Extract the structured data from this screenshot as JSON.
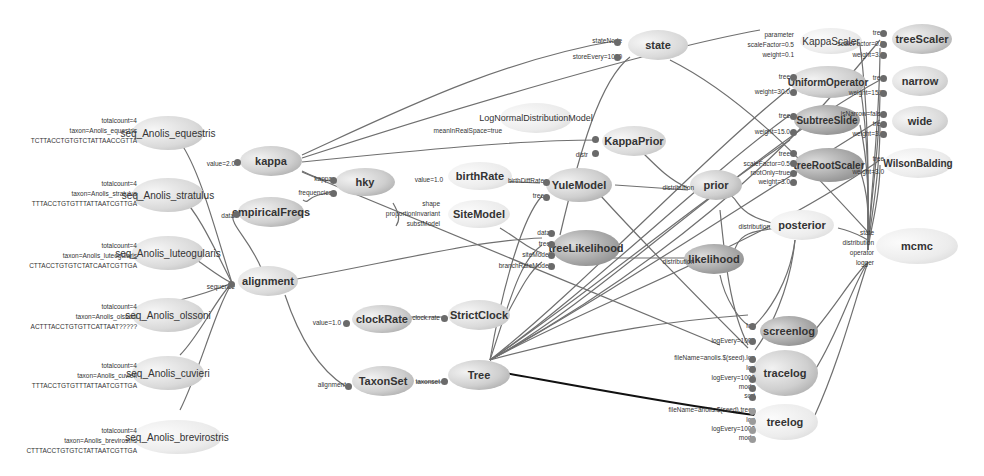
{
  "diagram": {
    "type": "BEAST model graph",
    "nodes": [
      {
        "id": "seq_Anolis_equestris",
        "label": "seq_Anolis_equestris",
        "inputs": [
          "totalcount=4",
          "taxon=Anolis_equestris",
          "TCTTACCTGTGTCTATTAACCGTTA"
        ]
      },
      {
        "id": "seq_Anolis_stratulus",
        "label": "seq_Anolis_stratulus",
        "inputs": [
          "totalcount=4",
          "taxon=Anolis_stratulus",
          "TTTACCTGTGTTTATTAATCGTTGA"
        ]
      },
      {
        "id": "seq_Anolis_luteogularis",
        "label": "seq_Anolis_luteogularis",
        "inputs": [
          "totalcount=4",
          "taxon=Anolis_luteogularis",
          "CTTACCTGTGTCTATCAATCGTTGA"
        ]
      },
      {
        "id": "seq_Anolis_olssoni",
        "label": "seq_Anolis_olssoni",
        "inputs": [
          "totalcount=4",
          "taxon=Anolis_olssoni",
          "ACTTTACCTGTGTTCATTAAT?????"
        ]
      },
      {
        "id": "seq_Anolis_cuvieri",
        "label": "seq_Anolis_cuvieri",
        "inputs": [
          "totalcount=4",
          "taxon=Anolis_cuvieri",
          "TTTACCTGTGTTTATTAATCGTTGA"
        ]
      },
      {
        "id": "seq_Anolis_brevirostris",
        "label": "seq_Anolis_brevirostris",
        "inputs": [
          "totalcount=4",
          "taxon=Anolis_brevirostris",
          "CTTTACCTGTGTCTATTAATCGTTGA"
        ]
      },
      {
        "id": "kappa",
        "label": "kappa",
        "inputs": [
          "value=2.0"
        ]
      },
      {
        "id": "empiricalFreqs",
        "label": "empiricalFreqs",
        "inputs": [
          "data"
        ]
      },
      {
        "id": "alignment",
        "label": "alignment",
        "inputs": [
          "sequence"
        ]
      },
      {
        "id": "hky",
        "label": "hky",
        "inputs": [
          "kappa",
          "frequencies"
        ]
      },
      {
        "id": "clockRate",
        "label": "clockRate",
        "inputs": [
          "value=1.0"
        ]
      },
      {
        "id": "TaxonSet",
        "label": "TaxonSet",
        "inputs": [
          "alignment"
        ]
      },
      {
        "id": "birthRate",
        "label": "birthRate",
        "inputs": [
          "value=1.0"
        ]
      },
      {
        "id": "SiteModel",
        "label": "SiteModel",
        "inputs": [
          "shape",
          "proportionInvariant",
          "substModel"
        ]
      },
      {
        "id": "StrictClock",
        "label": "StrictClock",
        "inputs": [
          "clock.rate"
        ]
      },
      {
        "id": "Tree",
        "label": "Tree",
        "inputs": [
          "taxonset"
        ]
      },
      {
        "id": "LogNormalDistributionModel",
        "label": "LogNormalDistributionModel",
        "inputs": [
          "M",
          "S",
          "meanInRealSpace=true"
        ]
      },
      {
        "id": "state",
        "label": "state",
        "inputs": [
          "stateNode",
          "storeEvery=1000"
        ]
      },
      {
        "id": "KappaPrior",
        "label": "KappaPrior",
        "inputs": [
          "x",
          "distr"
        ]
      },
      {
        "id": "YuleModel",
        "label": "YuleModel",
        "inputs": [
          "birthDiffRate",
          "tree"
        ]
      },
      {
        "id": "treeLikelihood",
        "label": "treeLikelihood",
        "inputs": [
          "data",
          "tree",
          "siteModel",
          "branchRateModel"
        ]
      },
      {
        "id": "prior",
        "label": "prior",
        "inputs": [
          "distribution"
        ]
      },
      {
        "id": "likelihood",
        "label": "likelihood",
        "inputs": [
          "distribution"
        ]
      },
      {
        "id": "posterior",
        "label": "posterior",
        "inputs": [
          "distribution"
        ]
      },
      {
        "id": "KappaScaler",
        "label": "KappaScaler",
        "inputs": [
          "parameter",
          "scaleFactor=0.5",
          "weight=0.1"
        ]
      },
      {
        "id": "UniformOperator",
        "label": "UniformOperator",
        "inputs": [
          "tree",
          "weight=30.0"
        ]
      },
      {
        "id": "SubtreeSlide",
        "label": "SubtreeSlide",
        "inputs": [
          "tree",
          "weight=15.0"
        ]
      },
      {
        "id": "treeRootScaler",
        "label": "treeRootScaler",
        "inputs": [
          "tree",
          "scaleFactor=0.5",
          "rootOnly=true",
          "weight=3.0"
        ]
      },
      {
        "id": "treeScaler",
        "label": "treeScaler",
        "inputs": [
          "tree",
          "scaleFactor=0.5",
          "weight=3.0"
        ]
      },
      {
        "id": "narrow",
        "label": "narrow",
        "inputs": [
          "tree",
          "weight=15.0"
        ]
      },
      {
        "id": "wide",
        "label": "wide",
        "inputs": [
          "isNarrow=false",
          "tree",
          "weight=3.0"
        ]
      },
      {
        "id": "WilsonBalding",
        "label": "WilsonBalding",
        "inputs": [
          "tree",
          "weight=3.0"
        ]
      },
      {
        "id": "mcmc",
        "label": "mcmc",
        "inputs": [
          "state",
          "distribution",
          "operator",
          "logger"
        ]
      },
      {
        "id": "screenlog",
        "label": "screenlog",
        "inputs": [
          "log",
          "logEvery=1000"
        ]
      },
      {
        "id": "tracelog",
        "label": "tracelog",
        "inputs": [
          "fileName=anolis.$(seed).log",
          "log",
          "logEvery=1000",
          "mode",
          "sort"
        ]
      },
      {
        "id": "treelog",
        "label": "treelog",
        "inputs": [
          "fileName=anolis.$(seed).trees",
          "log",
          "logEvery=1000",
          "mode"
        ]
      }
    ]
  }
}
